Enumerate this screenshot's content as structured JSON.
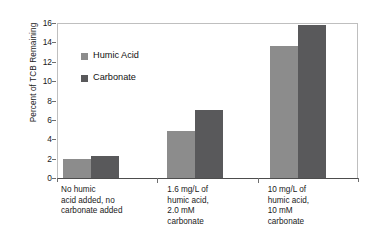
{
  "chart_data": {
    "type": "bar",
    "title": "",
    "xlabel": "",
    "ylabel": "Percent of TCB Remaining",
    "ylim": [
      0,
      16
    ],
    "ytick_step": 2,
    "yticks": [
      "16",
      "14",
      "12",
      "10",
      "8",
      "6",
      "4",
      "2",
      "0"
    ],
    "grid": false,
    "legend_position": "inside-upper-left",
    "categories": [
      "No humic acid added, no carbonate added",
      "1.6 mg/L of humic acid, 2.0 mM carbonate",
      "10 mg/L of humic acid, 10 mM carbonate"
    ],
    "category_lines": [
      [
        "No humic",
        "acid added, no",
        "carbonate added"
      ],
      [
        "1.6 mg/L of",
        "humic acid,",
        "2.0 mM",
        "carbonate"
      ],
      [
        "10 mg/L of",
        "humic acid,",
        "10 mM",
        "carbonate"
      ]
    ],
    "series": [
      {
        "name": "Humic Acid",
        "color": "#8c8c8c",
        "values": [
          2.0,
          4.9,
          13.6
        ]
      },
      {
        "name": "Carbonate",
        "color": "#59595b",
        "values": [
          2.3,
          7.0,
          15.8
        ]
      }
    ]
  },
  "legend": {
    "items": [
      {
        "label": "Humic Acid"
      },
      {
        "label": "Carbonate"
      }
    ]
  },
  "colors": {
    "series_a": "#8c8c8c",
    "series_b": "#59595b",
    "frame": "#bfbfbf",
    "axis": "#4d4d4d",
    "background": "#ffffff"
  }
}
